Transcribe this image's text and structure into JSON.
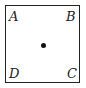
{
  "diagram": {
    "shape": "square",
    "vertices": [
      {
        "name": "A",
        "position": "top-left"
      },
      {
        "name": "B",
        "position": "top-right"
      },
      {
        "name": "C",
        "position": "bottom-right"
      },
      {
        "name": "D",
        "position": "bottom-left"
      }
    ],
    "center_point": "dot",
    "colors": {
      "stroke": "#222222",
      "background": "#ffffff"
    }
  }
}
